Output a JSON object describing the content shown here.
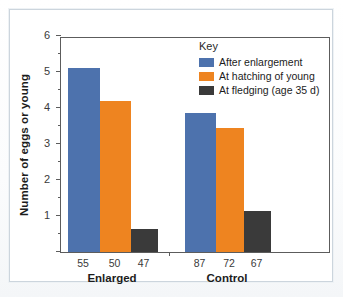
{
  "chart_data": {
    "type": "bar",
    "title": "",
    "xlabel": "",
    "ylabel": "Number of eggs or young",
    "ylim": [
      0,
      6
    ],
    "yticks": [
      0,
      1,
      2,
      3,
      4,
      5,
      6
    ],
    "ytick_labels": [
      "",
      "1",
      "2",
      "3",
      "4",
      "5",
      "6"
    ],
    "minor_tick_interval": 0.5,
    "grid": false,
    "legend_position": "inside top-right",
    "legend_title": "Key",
    "categories": [
      "Enlarged",
      "Control"
    ],
    "series": [
      {
        "name": "After enlargement",
        "color": "#4d72ad",
        "values": [
          5.1,
          3.85
        ]
      },
      {
        "name": "At hatching of young",
        "color": "#ee8420",
        "values": [
          4.2,
          3.45
        ]
      },
      {
        "name": "At fledging (age 35 d)",
        "color": "#3a3a3a",
        "values": [
          0.65,
          1.15
        ]
      }
    ],
    "sample_sizes": {
      "Enlarged": [
        "55",
        "50",
        "47"
      ],
      "Control": [
        "87",
        "72",
        "67"
      ]
    }
  },
  "axis": {
    "y_title": "Number of eggs or young",
    "y_labels": [
      "6",
      "5",
      "4",
      "3",
      "2",
      "1"
    ],
    "x_group_labels": [
      "Enlarged",
      "Control"
    ],
    "x_n_labels": [
      "55",
      "50",
      "47",
      "87",
      "72",
      "67"
    ]
  },
  "legend": {
    "title": "Key",
    "items": [
      {
        "label": "After enlargement",
        "color": "#4d72ad"
      },
      {
        "label": "At hatching of young",
        "color": "#ee8420"
      },
      {
        "label": "At fledging (age 35 d)",
        "color": "#3a3a3a"
      }
    ]
  }
}
